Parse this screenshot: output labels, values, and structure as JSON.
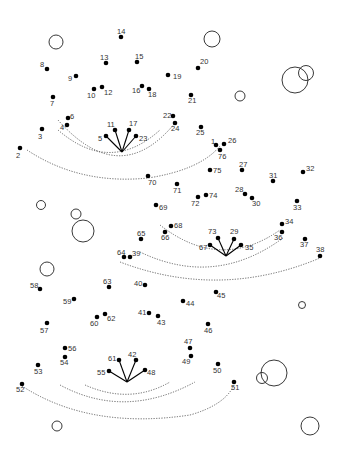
{
  "puzzle": {
    "type": "connect-the-dots",
    "dot_color": "#000000",
    "label_color": "#333333",
    "guide_color": "#555555",
    "dots": [
      {
        "n": 1,
        "x": 216,
        "y": 145,
        "lx": 211,
        "ly": 144
      },
      {
        "n": 2,
        "x": 20,
        "y": 148,
        "lx": 16,
        "ly": 158
      },
      {
        "n": 3,
        "x": 42,
        "y": 129,
        "lx": 38,
        "ly": 139
      },
      {
        "n": 4,
        "x": 67,
        "y": 125,
        "lx": 60,
        "ly": 130
      },
      {
        "n": 5,
        "x": 106,
        "y": 136,
        "lx": 98,
        "ly": 141
      },
      {
        "n": 6,
        "x": 68,
        "y": 118,
        "lx": 70,
        "ly": 119
      },
      {
        "n": 7,
        "x": 53,
        "y": 97,
        "lx": 50,
        "ly": 106
      },
      {
        "n": 8,
        "x": 47,
        "y": 69,
        "lx": 40,
        "ly": 67
      },
      {
        "n": 9,
        "x": 76,
        "y": 76,
        "lx": 68,
        "ly": 81
      },
      {
        "n": 10,
        "x": 94,
        "y": 89,
        "lx": 87,
        "ly": 98
      },
      {
        "n": 11,
        "x": 115,
        "y": 130,
        "lx": 107,
        "ly": 127
      },
      {
        "n": 12,
        "x": 102,
        "y": 87,
        "lx": 104,
        "ly": 95
      },
      {
        "n": 13,
        "x": 106,
        "y": 63,
        "lx": 100,
        "ly": 60
      },
      {
        "n": 14,
        "x": 121,
        "y": 37,
        "lx": 117,
        "ly": 34
      },
      {
        "n": 15,
        "x": 137,
        "y": 62,
        "lx": 135,
        "ly": 59
      },
      {
        "n": 16,
        "x": 142,
        "y": 86,
        "lx": 132,
        "ly": 93
      },
      {
        "n": 17,
        "x": 129,
        "y": 130,
        "lx": 129,
        "ly": 126
      },
      {
        "n": 18,
        "x": 149,
        "y": 89,
        "lx": 148,
        "ly": 97
      },
      {
        "n": 19,
        "x": 168,
        "y": 75,
        "lx": 173,
        "ly": 79
      },
      {
        "n": 20,
        "x": 198,
        "y": 68,
        "lx": 200,
        "ly": 64
      },
      {
        "n": 21,
        "x": 191,
        "y": 95,
        "lx": 188,
        "ly": 103
      },
      {
        "n": 22,
        "x": 173,
        "y": 116,
        "lx": 163,
        "ly": 118
      },
      {
        "n": 23,
        "x": 136,
        "y": 136,
        "lx": 139,
        "ly": 141
      },
      {
        "n": 24,
        "x": 175,
        "y": 123,
        "lx": 171,
        "ly": 131
      },
      {
        "n": 25,
        "x": 201,
        "y": 127,
        "lx": 196,
        "ly": 135
      },
      {
        "n": 26,
        "x": 224,
        "y": 144,
        "lx": 228,
        "ly": 143
      },
      {
        "n": 27,
        "x": 242,
        "y": 170,
        "lx": 239,
        "ly": 167
      },
      {
        "n": 28,
        "x": 245,
        "y": 194,
        "lx": 235,
        "ly": 192
      },
      {
        "n": 29,
        "x": 234,
        "y": 239,
        "lx": 230,
        "ly": 234
      },
      {
        "n": 30,
        "x": 252,
        "y": 198,
        "lx": 252,
        "ly": 206
      },
      {
        "n": 31,
        "x": 273,
        "y": 181,
        "lx": 269,
        "ly": 178
      },
      {
        "n": 32,
        "x": 303,
        "y": 172,
        "lx": 306,
        "ly": 171
      },
      {
        "n": 33,
        "x": 297,
        "y": 201,
        "lx": 293,
        "ly": 210
      },
      {
        "n": 34,
        "x": 282,
        "y": 224,
        "lx": 285,
        "ly": 224
      },
      {
        "n": 35,
        "x": 241,
        "y": 245,
        "lx": 245,
        "ly": 250
      },
      {
        "n": 36,
        "x": 282,
        "y": 232,
        "lx": 274,
        "ly": 240
      },
      {
        "n": 37,
        "x": 305,
        "y": 239,
        "lx": 300,
        "ly": 247
      },
      {
        "n": 38,
        "x": 320,
        "y": 256,
        "lx": 316,
        "ly": 252
      },
      {
        "n": 39,
        "x": 130,
        "y": 257,
        "lx": 132,
        "ly": 256
      },
      {
        "n": 40,
        "x": 145,
        "y": 285,
        "lx": 134,
        "ly": 286
      },
      {
        "n": 41,
        "x": 149,
        "y": 313,
        "lx": 138,
        "ly": 315
      },
      {
        "n": 42,
        "x": 136,
        "y": 360,
        "lx": 128,
        "ly": 357
      },
      {
        "n": 43,
        "x": 158,
        "y": 316,
        "lx": 157,
        "ly": 325
      },
      {
        "n": 44,
        "x": 183,
        "y": 301,
        "lx": 186,
        "ly": 306
      },
      {
        "n": 45,
        "x": 216,
        "y": 292,
        "lx": 217,
        "ly": 298
      },
      {
        "n": 46,
        "x": 208,
        "y": 324,
        "lx": 204,
        "ly": 333
      },
      {
        "n": 47,
        "x": 190,
        "y": 348,
        "lx": 184,
        "ly": 344
      },
      {
        "n": 48,
        "x": 145,
        "y": 370,
        "lx": 147,
        "ly": 375
      },
      {
        "n": 49,
        "x": 191,
        "y": 356,
        "lx": 182,
        "ly": 364
      },
      {
        "n": 50,
        "x": 218,
        "y": 364,
        "lx": 213,
        "ly": 373
      },
      {
        "n": 51,
        "x": 234,
        "y": 382,
        "lx": 231,
        "ly": 390
      },
      {
        "n": 52,
        "x": 22,
        "y": 384,
        "lx": 16,
        "ly": 392
      },
      {
        "n": 53,
        "x": 38,
        "y": 365,
        "lx": 34,
        "ly": 374
      },
      {
        "n": 54,
        "x": 65,
        "y": 357,
        "lx": 60,
        "ly": 365
      },
      {
        "n": 55,
        "x": 109,
        "y": 371,
        "lx": 97,
        "ly": 375
      },
      {
        "n": 56,
        "x": 65,
        "y": 348,
        "lx": 68,
        "ly": 351
      },
      {
        "n": 57,
        "x": 47,
        "y": 323,
        "lx": 40,
        "ly": 333
      },
      {
        "n": 58,
        "x": 40,
        "y": 289,
        "lx": 30,
        "ly": 288
      },
      {
        "n": 59,
        "x": 74,
        "y": 299,
        "lx": 63,
        "ly": 304
      },
      {
        "n": 60,
        "x": 97,
        "y": 317,
        "lx": 90,
        "ly": 326
      },
      {
        "n": 61,
        "x": 119,
        "y": 360,
        "lx": 108,
        "ly": 361
      },
      {
        "n": 62,
        "x": 105,
        "y": 314,
        "lx": 107,
        "ly": 321
      },
      {
        "n": 63,
        "x": 109,
        "y": 287,
        "lx": 103,
        "ly": 284
      },
      {
        "n": 64,
        "x": 124,
        "y": 257,
        "lx": 117,
        "ly": 255
      },
      {
        "n": 65,
        "x": 141,
        "y": 239,
        "lx": 137,
        "ly": 236
      },
      {
        "n": 66,
        "x": 165,
        "y": 232,
        "lx": 161,
        "ly": 240
      },
      {
        "n": 67,
        "x": 210,
        "y": 245,
        "lx": 199,
        "ly": 250
      },
      {
        "n": 68,
        "x": 171,
        "y": 226,
        "lx": 174,
        "ly": 228
      },
      {
        "n": 69,
        "x": 156,
        "y": 205,
        "lx": 159,
        "ly": 210
      },
      {
        "n": 70,
        "x": 148,
        "y": 176,
        "lx": 148,
        "ly": 185
      },
      {
        "n": 71,
        "x": 177,
        "y": 184,
        "lx": 173,
        "ly": 193
      },
      {
        "n": 72,
        "x": 198,
        "y": 197,
        "lx": 191,
        "ly": 206
      },
      {
        "n": 73,
        "x": 218,
        "y": 238,
        "lx": 208,
        "ly": 234
      },
      {
        "n": 74,
        "x": 206,
        "y": 195,
        "lx": 209,
        "ly": 198
      },
      {
        "n": 75,
        "x": 210,
        "y": 170,
        "lx": 213,
        "ly": 173
      },
      {
        "n": 76,
        "x": 220,
        "y": 150,
        "lx": 218,
        "ly": 159
      }
    ],
    "fans": [
      {
        "hub": [
          122,
          152
        ],
        "tips": [
          5,
          11,
          17,
          23
        ]
      },
      {
        "hub": [
          226,
          256
        ],
        "tips": [
          67,
          73,
          29,
          35
        ]
      },
      {
        "hub": [
          127,
          382
        ],
        "tips": [
          55,
          61,
          42,
          48
        ]
      }
    ],
    "circles": [
      {
        "cx": 56,
        "cy": 42,
        "r": 7
      },
      {
        "cx": 212,
        "cy": 39,
        "r": 8
      },
      {
        "cx": 295,
        "cy": 80,
        "r": 13
      },
      {
        "cx": 306,
        "cy": 73,
        "r": 7.5
      },
      {
        "cx": 240,
        "cy": 96,
        "r": 5
      },
      {
        "cx": 41,
        "cy": 205,
        "r": 4.5
      },
      {
        "cx": 76,
        "cy": 214,
        "r": 5
      },
      {
        "cx": 83,
        "cy": 231,
        "r": 11
      },
      {
        "cx": 47,
        "cy": 269,
        "r": 7
      },
      {
        "cx": 302,
        "cy": 305,
        "r": 3.5
      },
      {
        "cx": 274,
        "cy": 373,
        "r": 13
      },
      {
        "cx": 262,
        "cy": 378,
        "r": 5.5
      },
      {
        "cx": 57,
        "cy": 426,
        "r": 5
      },
      {
        "cx": 310,
        "cy": 426,
        "r": 9
      }
    ],
    "guides": [
      "M58 130 Q110 175 160 130",
      "M58 120 Q120 190 175 123",
      "M27 150 Q80 185 148 178 Q200 170 220 146",
      "M160 225 Q220 272 280 230",
      "M140 252 Q215 288 283 238",
      "M120 262 Q220 300 320 258",
      "M85 385 Q130 405 170 382",
      "M60 385 Q125 420 195 382",
      "M22 386 Q90 430 190 415 Q225 405 234 385"
    ]
  }
}
